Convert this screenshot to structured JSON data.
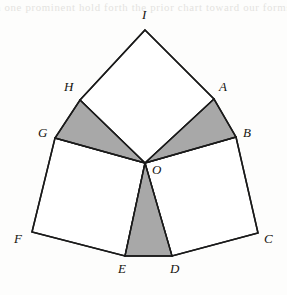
{
  "figure": {
    "background_color": "#fdfdfc",
    "stroke_color": "#1a1a1a",
    "shade_color": "#a8a8a8",
    "fill_color": "#ffffff",
    "ghost_text": "a one prominent hold forth the prior chart toward our forms",
    "vertices": {
      "I": {
        "label": "I",
        "x": 145,
        "y": 30,
        "label_x": 142,
        "label_y": 8
      },
      "A": {
        "label": "A",
        "x": 214,
        "y": 99,
        "label_x": 219,
        "label_y": 80
      },
      "B": {
        "label": "B",
        "x": 236,
        "y": 137,
        "label_x": 243,
        "label_y": 126
      },
      "C": {
        "label": "C",
        "x": 258,
        "y": 233,
        "label_x": 264,
        "label_y": 232
      },
      "D": {
        "label": "D",
        "x": 172,
        "y": 256,
        "label_x": 170,
        "label_y": 262
      },
      "E": {
        "label": "E",
        "x": 125,
        "y": 256,
        "label_x": 118,
        "label_y": 262
      },
      "F": {
        "label": "F",
        "x": 32,
        "y": 232,
        "label_x": 14,
        "label_y": 232
      },
      "G": {
        "label": "G",
        "x": 55,
        "y": 138,
        "label_x": 38,
        "label_y": 126
      },
      "H": {
        "label": "H",
        "x": 80,
        "y": 100,
        "label_x": 64,
        "label_y": 80
      },
      "O": {
        "label": "O",
        "x": 145,
        "y": 163,
        "label_x": 152,
        "label_y": 163
      }
    },
    "squares": [
      {
        "name": "square-OAIH",
        "points": "145,163 214,99 145,30 80,100",
        "shaded": false
      },
      {
        "name": "square-OBCD",
        "points": "145,163 236,137 258,233 172,256",
        "shaded": false
      },
      {
        "name": "square-OEFG",
        "points": "145,163 125,256 32,232 55,138",
        "shaded": false
      }
    ],
    "shaded_triangles": [
      {
        "name": "triangle-OAB",
        "points": "145,163 214,99 236,137"
      },
      {
        "name": "triangle-OGH",
        "points": "145,163 80,100 55,138"
      },
      {
        "name": "triangle-ODE",
        "points": "145,163 125,256 172,256"
      }
    ],
    "spokes": [
      {
        "name": "spoke-OA",
        "x1": 145,
        "y1": 163,
        "x2": 214,
        "y2": 99
      },
      {
        "name": "spoke-OB",
        "x1": 145,
        "y1": 163,
        "x2": 236,
        "y2": 137
      },
      {
        "name": "spoke-OD",
        "x1": 145,
        "y1": 163,
        "x2": 172,
        "y2": 256
      },
      {
        "name": "spoke-OE",
        "x1": 145,
        "y1": 163,
        "x2": 125,
        "y2": 256
      },
      {
        "name": "spoke-OG",
        "x1": 145,
        "y1": 163,
        "x2": 55,
        "y2": 138
      },
      {
        "name": "spoke-OH",
        "x1": 145,
        "y1": 163,
        "x2": 80,
        "y2": 100
      }
    ],
    "outline": "145,30 214,99 236,137 258,233 172,256 125,256 32,232 55,138 80,100"
  }
}
